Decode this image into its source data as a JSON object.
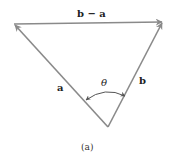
{
  "figure": {
    "caption": "(a)",
    "colors": {
      "stroke": "#8a8a8a",
      "text": "#222222"
    },
    "vectors": [
      {
        "name": "a",
        "label": "a",
        "from": "bottom",
        "to": "left-top"
      },
      {
        "name": "b",
        "label": "b",
        "from": "bottom",
        "to": "right-top"
      },
      {
        "name": "b-minus-a",
        "label": "b − a",
        "from": "left-top",
        "to": "right-top"
      }
    ],
    "angle": {
      "label": "θ",
      "between": [
        "a",
        "b"
      ],
      "double_headed_arc": true
    },
    "labels": {
      "a": "a",
      "b": "b",
      "b_minus_a": "b − a",
      "theta": "θ"
    }
  }
}
